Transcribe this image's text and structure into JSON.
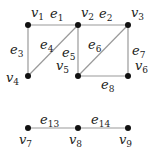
{
  "graph": {
    "nodes": [
      {
        "id": "v1",
        "label": "v",
        "sub": "1",
        "x": 28,
        "y": 25,
        "lx": 3,
        "ly": -8
      },
      {
        "id": "v2",
        "label": "v",
        "sub": "2",
        "x": 78,
        "y": 25,
        "lx": 3,
        "ly": -8
      },
      {
        "id": "v3",
        "label": "v",
        "sub": "3",
        "x": 128,
        "y": 25,
        "lx": 3,
        "ly": -8
      },
      {
        "id": "v4",
        "label": "v",
        "sub": "4",
        "x": 28,
        "y": 76,
        "lx": -22,
        "ly": 6
      },
      {
        "id": "v5",
        "label": "v",
        "sub": "5",
        "x": 78,
        "y": 76,
        "lx": -22,
        "ly": -6
      },
      {
        "id": "v6",
        "label": "v",
        "sub": "6",
        "x": 128,
        "y": 76,
        "lx": 7,
        "ly": -6
      },
      {
        "id": "v7",
        "label": "v",
        "sub": "7",
        "x": 28,
        "y": 128,
        "lx": -9,
        "ly": 16
      },
      {
        "id": "v8",
        "label": "v",
        "sub": "8",
        "x": 78,
        "y": 128,
        "lx": -9,
        "ly": 16
      },
      {
        "id": "v9",
        "label": "v",
        "sub": "9",
        "x": 128,
        "y": 128,
        "lx": -9,
        "ly": 16
      }
    ],
    "edges": [
      {
        "id": "e1",
        "label": "e",
        "sub": "1",
        "from": "v1",
        "to": "v2",
        "lx": 50,
        "ly": 18
      },
      {
        "id": "e2",
        "label": "e",
        "sub": "2",
        "from": "v2",
        "to": "v3",
        "lx": 99,
        "ly": 18
      },
      {
        "id": "e3",
        "label": "e",
        "sub": "3",
        "from": "v1",
        "to": "v4",
        "lx": 10,
        "ly": 54
      },
      {
        "id": "e4",
        "label": "e",
        "sub": "4",
        "from": "v4",
        "to": "v2",
        "lx": 40,
        "ly": 49
      },
      {
        "id": "e5",
        "label": "e",
        "sub": "5",
        "from": "v2",
        "to": "v5",
        "lx": 62,
        "ly": 57
      },
      {
        "id": "e6",
        "label": "e",
        "sub": "6",
        "from": "v5",
        "to": "v3",
        "lx": 88,
        "ly": 49
      },
      {
        "id": "e7",
        "label": "e",
        "sub": "7",
        "from": "v3",
        "to": "v6",
        "lx": 132,
        "ly": 55
      },
      {
        "id": "e8",
        "label": "e",
        "sub": "8",
        "from": "v5",
        "to": "v6",
        "lx": 101,
        "ly": 89
      },
      {
        "id": "e13",
        "label": "e",
        "sub": "13",
        "from": "v7",
        "to": "v8",
        "lx": 40,
        "ly": 124
      },
      {
        "id": "e14",
        "label": "e",
        "sub": "14",
        "from": "v8",
        "to": "v9",
        "lx": 91,
        "ly": 124
      }
    ],
    "colors": {
      "edge": "#9a9a9a",
      "node": "#111111",
      "text": "#222222"
    }
  }
}
